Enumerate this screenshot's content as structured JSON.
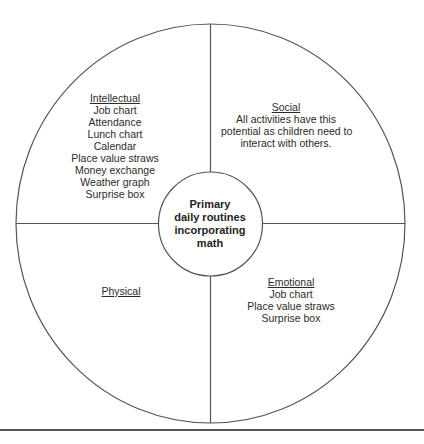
{
  "diagram": {
    "center": {
      "lines": [
        "Primary",
        "daily routines",
        "incorporating",
        "math"
      ]
    },
    "quadrants": {
      "intellectual": {
        "heading": "Intellectual",
        "items": [
          "Job chart",
          "Attendance",
          "Lunch chart",
          "Calendar",
          "Place value straws",
          "Money exchange",
          "Weather graph",
          "Surprise box"
        ]
      },
      "social": {
        "heading": "Social",
        "items": [
          "All activities have this",
          "potential as children need to",
          "interact with others."
        ]
      },
      "physical": {
        "heading": "Physical",
        "items": []
      },
      "emotional": {
        "heading": "Emotional",
        "items": [
          "Job chart",
          "Place value straws",
          "Surprise box"
        ]
      }
    },
    "colors": {
      "line": "#555555",
      "text": "#2b2b2b"
    }
  }
}
